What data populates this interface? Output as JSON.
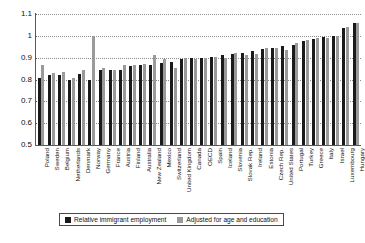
{
  "chart_data": {
    "type": "bar",
    "title": "",
    "subtitle": "",
    "xlabel": "",
    "ylabel": "",
    "ylim": [
      0.5,
      1.1
    ],
    "ytick_labels": [
      "1.1",
      "1",
      "0.9",
      "0.8",
      "0.7",
      "0.6",
      "0.5"
    ],
    "ytick_values": [
      1.1,
      1.0,
      0.9,
      0.8,
      0.7,
      0.6,
      0.5
    ],
    "grid": true,
    "grid_style": "dotted-horizontal",
    "legend_position": "bottom",
    "categories": [
      "Poland",
      "Sweden",
      "Belgium",
      "Netherlands",
      "Denmark",
      "Norway",
      "Germany",
      "France",
      "Austria",
      "Finland",
      "Australia",
      "New Zealand",
      "Mexico",
      "Switzerland",
      "United Kingdom",
      "Canada",
      "OECD",
      "Spain",
      "Iceland",
      "Slovenia",
      "Slovak Rep.",
      "Ireland",
      "Estonia",
      "Czech Rep.",
      "United States",
      "Portugal",
      "Turkey",
      "Greece",
      "Italy",
      "Israel",
      "Luxembourg",
      "Hungary"
    ],
    "series": [
      {
        "name": "Relative immigrant employment",
        "color": "#1a1a1a",
        "values": [
          0.805,
          0.82,
          0.82,
          0.8,
          0.825,
          0.8,
          0.845,
          0.845,
          0.845,
          0.86,
          0.865,
          0.865,
          0.875,
          0.88,
          0.895,
          0.9,
          0.9,
          0.905,
          0.91,
          0.915,
          0.92,
          0.93,
          0.94,
          0.945,
          0.955,
          0.96,
          0.975,
          0.985,
          0.995,
          1.0,
          1.035,
          1.06
        ]
      },
      {
        "name": "Adjusted for age and education",
        "color": "#9a9a9a",
        "values": [
          0.865,
          0.83,
          0.835,
          0.805,
          0.845,
          1.0,
          0.855,
          0.845,
          0.865,
          0.865,
          0.87,
          0.91,
          0.895,
          0.855,
          0.9,
          0.895,
          0.9,
          0.905,
          0.9,
          0.92,
          0.91,
          0.915,
          0.945,
          0.945,
          0.935,
          0.965,
          0.98,
          0.99,
          0.99,
          1.0,
          1.04,
          1.06
        ]
      }
    ]
  },
  "legend": {
    "items": [
      {
        "label": "Relative immigrant employment",
        "swatch": "relative"
      },
      {
        "label": "Adjusted for age and education",
        "swatch": "adjusted"
      }
    ]
  }
}
